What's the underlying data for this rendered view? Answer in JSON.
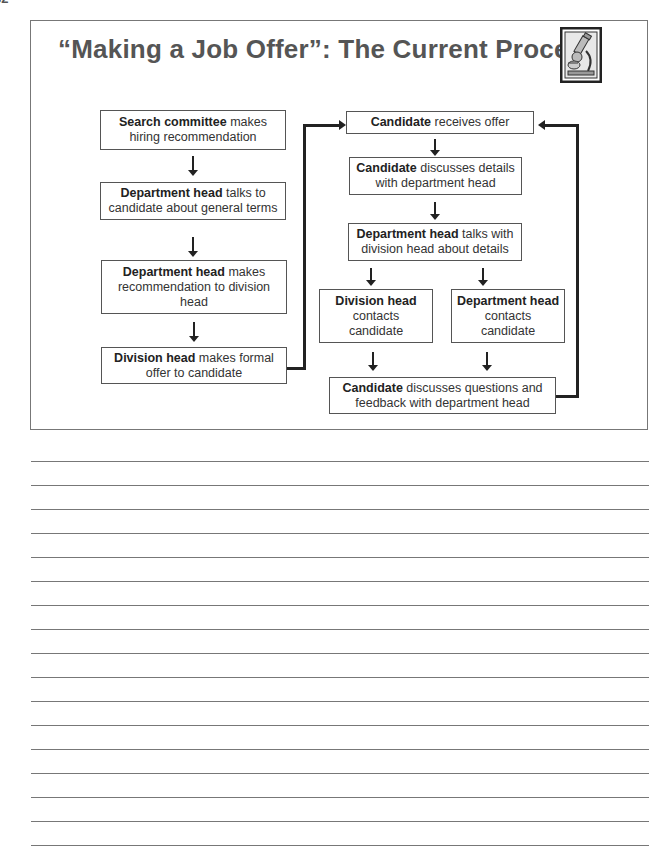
{
  "page": {
    "page_number_fragment": "32"
  },
  "slide": {
    "title": "“Making a Job Offer”: The Current Process",
    "icon": "microscope-icon"
  },
  "flow": {
    "left_column": [
      {
        "bold": "Search committee",
        "rest": " makes hiring recommendation"
      },
      {
        "bold": "Department head",
        "rest": " talks to candidate about general terms"
      },
      {
        "bold": "Department head",
        "rest": " makes recommendation to division head"
      },
      {
        "bold": "Division head",
        "rest": " makes formal offer to candidate"
      }
    ],
    "right_column": [
      {
        "bold": "Candidate",
        "rest": " receives offer"
      },
      {
        "bold": "Candidate",
        "rest": " discusses details with department head"
      },
      {
        "bold": "Department head",
        "rest": " talks with division head about details"
      }
    ],
    "branches": [
      {
        "bold": "Division head",
        "rest": " contacts candidate"
      },
      {
        "bold": "Department head",
        "rest": " contacts candidate"
      }
    ],
    "final": {
      "bold": "Candidate",
      "rest": " discusses questions and feedback with department head"
    }
  },
  "notes": {
    "line_count": 17
  }
}
